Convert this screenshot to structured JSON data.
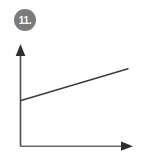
{
  "figure": {
    "badge": {
      "label": "11.",
      "shape": "circle",
      "fill_color": "#7b7b7b",
      "text_color": "#ffffff"
    },
    "background_color": "#ffffff"
  },
  "chart_data": {
    "type": "line",
    "title": "",
    "subtitle": "",
    "xlabel": "",
    "ylabel": "",
    "grid": false,
    "legend": null,
    "legend_position": "none",
    "tick_labels_x": [],
    "tick_labels_y": [],
    "xlim": [
      0,
      100
    ],
    "ylim": [
      0,
      100
    ],
    "axis_style": {
      "arrow_x": true,
      "arrow_y": true,
      "color": "#4a4a4a",
      "ticks": false
    },
    "annotations": [],
    "series": [
      {
        "name": "",
        "color": "#3c3c3c",
        "x": [
          0,
          100
        ],
        "values": [
          49,
          83
        ]
      }
    ]
  }
}
